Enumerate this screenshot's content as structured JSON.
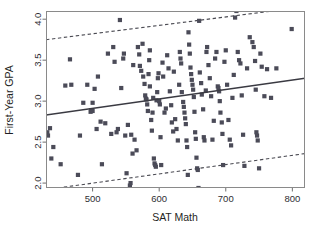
{
  "figure": {
    "background_color": "#ffffff",
    "plot_box": {
      "left": 46,
      "top": 11,
      "right": 305,
      "bottom": 188
    },
    "point_color": "#4b4b58",
    "line_color": "#3a3a42",
    "frame_color": "#8a8a8a"
  },
  "chart_data": {
    "type": "scatter",
    "title": "",
    "subtitle": "",
    "xlabel": "SAT Math",
    "ylabel": "First-Year GPA",
    "xlim": [
      430,
      819
    ],
    "ylim": [
      1.94,
      4.1
    ],
    "xticks": [
      500,
      600,
      700,
      800
    ],
    "xtick_labels": [
      "500",
      "600",
      "700",
      "800"
    ],
    "yticks": [
      2.0,
      2.5,
      3.0,
      3.5,
      4.0
    ],
    "ytick_labels": [
      "2.0",
      "2.5",
      "3.0",
      "3.5",
      "4.0"
    ],
    "grid": false,
    "legend": null,
    "legend_position": "none",
    "annotations": [],
    "series": [
      {
        "name": "students",
        "type": "scatter",
        "marker": "filled-square",
        "marker_size": 2.1,
        "color": "#4b4b58",
        "points": [
          [
            432,
            2.62
          ],
          [
            433,
            2.58
          ],
          [
            436,
            2.67
          ],
          [
            438,
            2.3
          ],
          [
            441,
            2.44
          ],
          [
            452,
            2.23
          ],
          [
            459,
            3.19
          ],
          [
            466,
            3.51
          ],
          [
            468,
            3.2
          ],
          [
            478,
            2.1
          ],
          [
            481,
            2.58
          ],
          [
            486,
            2.98
          ],
          [
            492,
            3.2
          ],
          [
            497,
            2.87
          ],
          [
            498,
            2.89
          ],
          [
            500,
            2.88
          ],
          [
            500,
            2.98
          ],
          [
            503,
            3.15
          ],
          [
            506,
            2.66
          ],
          [
            508,
            3.3
          ],
          [
            512,
            2.75
          ],
          [
            514,
            2.23
          ],
          [
            519,
            2.73
          ],
          [
            523,
            3.58
          ],
          [
            528,
            2.6
          ],
          [
            531,
            3.66
          ],
          [
            533,
            3.48
          ],
          [
            536,
            2.62
          ],
          [
            538,
            2.66
          ],
          [
            541,
            3.99
          ],
          [
            543,
            3.16
          ],
          [
            546,
            3.52
          ],
          [
            547,
            3.58
          ],
          [
            549,
            2.58
          ],
          [
            551,
            2.12
          ],
          [
            553,
            2.71
          ],
          [
            556,
            1.97
          ],
          [
            557,
            2.0
          ],
          [
            558,
            2.59
          ],
          [
            560,
            2.36
          ],
          [
            561,
            3.44
          ],
          [
            563,
            2.53
          ],
          [
            566,
            2.4
          ],
          [
            568,
            3.66
          ],
          [
            570,
            3.57
          ],
          [
            571,
            3.43
          ],
          [
            573,
            3.37
          ],
          [
            575,
            3.7
          ],
          [
            576,
            3.3
          ],
          [
            578,
            3.21
          ],
          [
            579,
            3.07
          ],
          [
            580,
            3.03
          ],
          [
            581,
            3.02
          ],
          [
            582,
            2.96
          ],
          [
            583,
            2.88
          ],
          [
            584,
            3.33
          ],
          [
            585,
            3.5
          ],
          [
            586,
            3.62
          ],
          [
            586,
            3.18
          ],
          [
            588,
            2.77
          ],
          [
            589,
            2.64
          ],
          [
            590,
            2.86
          ],
          [
            591,
            3.04
          ],
          [
            592,
            2.3
          ],
          [
            593,
            2.24
          ],
          [
            594,
            2.22
          ],
          [
            595,
            2.2
          ],
          [
            596,
            3.01
          ],
          [
            597,
            3.11
          ],
          [
            598,
            3.28
          ],
          [
            599,
            3.34
          ],
          [
            600,
            3.0
          ],
          [
            601,
            2.96
          ],
          [
            602,
            2.56
          ],
          [
            603,
            2.22
          ],
          [
            605,
            3.47
          ],
          [
            606,
            3.3
          ],
          [
            608,
            2.86
          ],
          [
            610,
            2.91
          ],
          [
            612,
            3.56
          ],
          [
            614,
            3.4
          ],
          [
            616,
            3.12
          ],
          [
            618,
            2.95
          ],
          [
            619,
            2.74
          ],
          [
            621,
            2.63
          ],
          [
            622,
            3.36
          ],
          [
            624,
            2.78
          ],
          [
            626,
            2.66
          ],
          [
            628,
            2.52
          ],
          [
            630,
            3.2
          ],
          [
            631,
            3.6
          ],
          [
            632,
            3.52
          ],
          [
            633,
            3.46
          ],
          [
            634,
            3.11
          ],
          [
            636,
            2.99
          ],
          [
            637,
            2.93
          ],
          [
            638,
            2.86
          ],
          [
            639,
            2.79
          ],
          [
            640,
            2.72
          ],
          [
            641,
            2.52
          ],
          [
            642,
            2.44
          ],
          [
            643,
            2.1
          ],
          [
            644,
            3.84
          ],
          [
            645,
            3.69
          ],
          [
            646,
            3.58
          ],
          [
            647,
            3.41
          ],
          [
            648,
            3.33
          ],
          [
            649,
            3.26
          ],
          [
            650,
            3.2
          ],
          [
            651,
            3.14
          ],
          [
            652,
            3.05
          ],
          [
            653,
            2.87
          ],
          [
            654,
            2.62
          ],
          [
            655,
            2.54
          ],
          [
            656,
            2.31
          ],
          [
            657,
            2.18
          ],
          [
            658,
            2.16
          ],
          [
            659,
            1.94
          ],
          [
            660,
            3.98
          ],
          [
            661,
            3.35
          ],
          [
            663,
            3.22
          ],
          [
            664,
            3.08
          ],
          [
            666,
            2.9
          ],
          [
            667,
            2.56
          ],
          [
            668,
            2.52
          ],
          [
            670,
            3.13
          ],
          [
            671,
            3.6
          ],
          [
            672,
            3.66
          ],
          [
            674,
            3.44
          ],
          [
            676,
            3.28
          ],
          [
            678,
            3.06
          ],
          [
            680,
            2.53
          ],
          [
            682,
            2.76
          ],
          [
            684,
            3.52
          ],
          [
            686,
            3.6
          ],
          [
            688,
            3.18
          ],
          [
            689,
            3.16
          ],
          [
            690,
            3.12
          ],
          [
            691,
            3.0
          ],
          [
            692,
            2.86
          ],
          [
            694,
            2.74
          ],
          [
            695,
            2.6
          ],
          [
            696,
            2.22
          ],
          [
            698,
            3.48
          ],
          [
            700,
            3.62
          ],
          [
            702,
            3.2
          ],
          [
            704,
            2.77
          ],
          [
            706,
            2.53
          ],
          [
            708,
            2.46
          ],
          [
            710,
            3.04
          ],
          [
            712,
            3.32
          ],
          [
            714,
            4.02
          ],
          [
            716,
            4.1
          ],
          [
            718,
            3.6
          ],
          [
            720,
            3.5
          ],
          [
            722,
            3.46
          ],
          [
            724,
            3.07
          ],
          [
            726,
            2.59
          ],
          [
            728,
            2.21
          ],
          [
            732,
            3.4
          ],
          [
            736,
            3.78
          ],
          [
            740,
            3.72
          ],
          [
            742,
            3.66
          ],
          [
            744,
            3.49
          ],
          [
            745,
            3.14
          ],
          [
            746,
            2.62
          ],
          [
            747,
            2.58
          ],
          [
            748,
            2.52
          ],
          [
            750,
            2.18
          ],
          [
            752,
            3.58
          ],
          [
            754,
            3.42
          ],
          [
            758,
            3.06
          ],
          [
            762,
            3.39
          ],
          [
            768,
            3.04
          ],
          [
            776,
            3.4
          ],
          [
            799,
            3.88
          ]
        ]
      },
      {
        "name": "regression-line",
        "type": "line",
        "style": "solid",
        "color": "#3a3a42",
        "endpoints": [
          [
            430,
            2.83
          ],
          [
            819,
            3.28
          ]
        ]
      },
      {
        "name": "upper-prediction-band",
        "type": "line",
        "style": "dashed",
        "color": "#4a4a52",
        "endpoints": [
          [
            430,
            3.75
          ],
          [
            819,
            4.15
          ]
        ]
      },
      {
        "name": "lower-prediction-band",
        "type": "line",
        "style": "dashed",
        "color": "#4a4a52",
        "endpoints": [
          [
            430,
            1.92
          ],
          [
            819,
            2.36
          ]
        ]
      }
    ]
  }
}
